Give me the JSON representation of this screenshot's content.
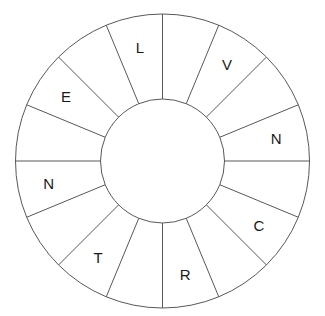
{
  "figure": {
    "type": "letter-wheel-diagram",
    "background_color": "#ffffff",
    "line_color": "#58585a",
    "text_color": "#1a1a1a"
  },
  "geometry": {
    "center_x": 162.5,
    "center_y": 161,
    "outer_radius": 147,
    "inner_radius": 62,
    "sector_count": 16,
    "sector_degrees": 22.5,
    "start_angle_degrees": 0,
    "label_radius": 116
  },
  "wheel": {
    "sector_count_label": "16",
    "sectors": [
      {
        "index": 0,
        "letter": "",
        "start_deg": 0.0,
        "end_deg": 22.5,
        "filled": false
      },
      {
        "index": 1,
        "letter": "V",
        "start_deg": 22.5,
        "end_deg": 45.0,
        "filled": true
      },
      {
        "index": 2,
        "letter": "",
        "start_deg": 45.0,
        "end_deg": 67.5,
        "filled": false
      },
      {
        "index": 3,
        "letter": "N",
        "start_deg": 67.5,
        "end_deg": 90.0,
        "filled": true
      },
      {
        "index": 4,
        "letter": "",
        "start_deg": 90.0,
        "end_deg": 112.5,
        "filled": false
      },
      {
        "index": 5,
        "letter": "C",
        "start_deg": 112.5,
        "end_deg": 135.0,
        "filled": true
      },
      {
        "index": 6,
        "letter": "",
        "start_deg": 135.0,
        "end_deg": 157.5,
        "filled": false
      },
      {
        "index": 7,
        "letter": "R",
        "start_deg": 157.5,
        "end_deg": 180.0,
        "filled": true
      },
      {
        "index": 8,
        "letter": "",
        "start_deg": 180.0,
        "end_deg": 202.5,
        "filled": false
      },
      {
        "index": 9,
        "letter": "T",
        "start_deg": 202.5,
        "end_deg": 225.0,
        "filled": true
      },
      {
        "index": 10,
        "letter": "",
        "start_deg": 225.0,
        "end_deg": 247.5,
        "filled": false
      },
      {
        "index": 11,
        "letter": "N",
        "start_deg": 247.5,
        "end_deg": 270.0,
        "filled": true
      },
      {
        "index": 12,
        "letter": "",
        "start_deg": 270.0,
        "end_deg": 292.5,
        "filled": false
      },
      {
        "index": 13,
        "letter": "E",
        "start_deg": 292.5,
        "end_deg": 315.0,
        "filled": true
      },
      {
        "index": 14,
        "letter": "",
        "start_deg": 315.0,
        "end_deg": 337.5,
        "filled": false
      },
      {
        "index": 15,
        "letter": "L",
        "start_deg": 337.5,
        "end_deg": 360.0,
        "filled": true
      }
    ],
    "letters_clockwise_from_top": [
      "L",
      "V",
      "N",
      "C",
      "R",
      "T",
      "N",
      "E"
    ]
  }
}
